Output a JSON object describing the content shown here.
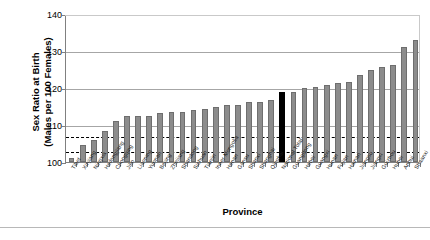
{
  "chart_data": {
    "type": "bar",
    "title": "",
    "xlabel": "Province",
    "ylabel": "Sex Ratio at Birth\n(Males per 100 Females)",
    "ylim": [
      100,
      140
    ],
    "yticks": [
      100,
      110,
      120,
      130,
      140
    ],
    "grid": true,
    "legend": "none",
    "highlight_category": "National Total",
    "highlight_color": "#000000",
    "bar_color": "#8c8c8c",
    "reference_lines": [
      {
        "value": 107,
        "style": "dashed",
        "color": "#000000"
      },
      {
        "value": 103,
        "style": "dashed",
        "color": "#000000"
      }
    ],
    "categories": [
      "Tibet",
      "Xinjiang",
      "Ningxia",
      "Heilongjiang",
      "Chongqing",
      "Jilin",
      "Liaoning",
      "Yunnan",
      "Beijing",
      "Zhejiang",
      "Shandong",
      "Sichuan",
      "Tianjin",
      "Inner Mongolia",
      "Henan",
      "Gansu",
      "Shanxi",
      "Shanghai",
      "Qinghai",
      "National Total",
      "Guangdong",
      "Hebei",
      "Guangxi",
      "Hunan",
      "Fujian",
      "Hainan",
      "Jiangsu",
      "Jiangxi",
      "Guizhou",
      "Hubei",
      "Anhui",
      "Shaanxi"
    ],
    "values": [
      101.0,
      104.5,
      106.0,
      108.5,
      111.0,
      112.5,
      112.5,
      112.5,
      113.3,
      113.6,
      113.6,
      114.0,
      114.3,
      115.0,
      115.3,
      115.3,
      116.2,
      116.2,
      116.8,
      119.0,
      118.8,
      119.9,
      120.3,
      120.7,
      121.3,
      121.5,
      123.5,
      125.0,
      125.8,
      126.2,
      131.2,
      133.0
    ]
  }
}
